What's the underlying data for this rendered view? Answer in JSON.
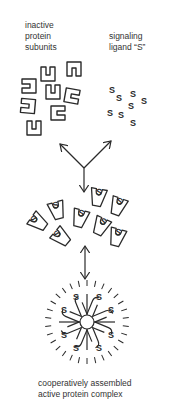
{
  "labels": {
    "subunits": [
      "inactive",
      "protein",
      "subunits"
    ],
    "ligand": [
      "signaling",
      "ligand “S”"
    ],
    "complex": [
      "cooperatively assembled",
      "active protein complex"
    ]
  },
  "ligand_glyph": "S",
  "colors": {
    "stroke": "#2a2a2a",
    "background": "#ffffff"
  },
  "icons": {
    "subunit": "inactive-subunit-icon",
    "ligand": "ligand-s-icon",
    "bound": "bound-subunit-icon",
    "complex": "active-complex-icon",
    "arrow": "arrow-icon"
  }
}
